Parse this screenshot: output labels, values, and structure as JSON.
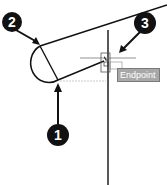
{
  "callouts": [
    {
      "label": "1"
    },
    {
      "label": "2"
    },
    {
      "label": "3"
    }
  ],
  "tooltip": {
    "text": "Endpoint",
    "icon": "endpoint-snap-icon"
  },
  "colors": {
    "line": "#111111",
    "tooltip_bg": "#a8a8a8",
    "crosshair": "#777777"
  }
}
